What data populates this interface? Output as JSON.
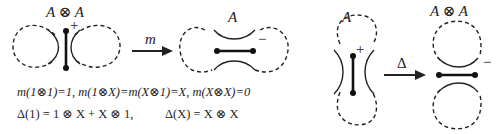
{
  "figure": {
    "panels": [
      {
        "id": "multiplication",
        "source_label": "A ⊗ A",
        "source_sign": "+",
        "operator": "m",
        "target_label": "A",
        "target_sign": "−"
      },
      {
        "id": "comultiplication",
        "source_label": "A",
        "source_sign": "+",
        "operator": "Δ",
        "target_label": "A ⊗ A",
        "target_sign": "−"
      }
    ],
    "equations": {
      "line1": "m(1⊗1)=1,  m(1⊗X)=m(X⊗1)=X,  m(X⊗X)=0",
      "line2a": "Δ(1) = 1 ⊗ X + X ⊗ 1,",
      "line2b": "Δ(X) = X ⊗ X"
    }
  }
}
